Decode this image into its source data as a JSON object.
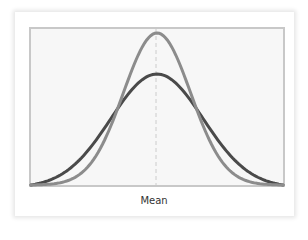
{
  "chart_data": {
    "type": "line",
    "title": "",
    "xlabel": "Mean",
    "ylabel": "",
    "grid": false,
    "legend": null,
    "mean_marker": {
      "x": 0,
      "style": "dashed",
      "color": "#cccccc"
    },
    "x_range": [
      -3,
      3
    ],
    "series": [
      {
        "name": "Narrow distribution (smaller spread)",
        "color": "#8c8c8c",
        "sigma": 0.8,
        "relative_peak": 1.0
      },
      {
        "name": "Wide distribution (larger spread)",
        "color": "#4a4a4a",
        "sigma": 1.1,
        "relative_peak": 0.73
      }
    ]
  },
  "colors": {
    "frame": "#c8c8c8",
    "plot_background": "#f7f7f7",
    "narrow_curve": "#8c8c8c",
    "wide_curve": "#4a4a4a",
    "mean_line": "#cccccc"
  }
}
